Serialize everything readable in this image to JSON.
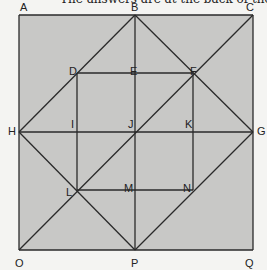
{
  "caption": "The answers are at the back of the book.",
  "diagram": {
    "fill": "#c8c8c6",
    "stroke": "#2a2a2a",
    "points": {
      "A": [
        19,
        15
      ],
      "B": [
        135,
        15
      ],
      "C": [
        253,
        15
      ],
      "D": [
        77,
        73
      ],
      "E": [
        135,
        73
      ],
      "F": [
        193,
        73
      ],
      "H": [
        19,
        132
      ],
      "I": [
        77,
        132
      ],
      "J": [
        135,
        132
      ],
      "K": [
        193,
        132
      ],
      "G": [
        253,
        132
      ],
      "L": [
        77,
        190
      ],
      "M": [
        135,
        190
      ],
      "N": [
        193,
        190
      ],
      "O": [
        19,
        250
      ],
      "P": [
        135,
        250
      ],
      "Q": [
        253,
        250
      ]
    },
    "labels": [
      {
        "text": "A",
        "x": 20,
        "y": 11
      },
      {
        "text": "B",
        "x": 131,
        "y": 11
      },
      {
        "text": "C",
        "x": 246,
        "y": 11
      },
      {
        "text": "D",
        "x": 69,
        "y": 75
      },
      {
        "text": "E",
        "x": 130,
        "y": 75
      },
      {
        "text": "F",
        "x": 190,
        "y": 75
      },
      {
        "text": "H",
        "x": 8,
        "y": 135
      },
      {
        "text": "I",
        "x": 71,
        "y": 128
      },
      {
        "text": "J",
        "x": 128,
        "y": 128
      },
      {
        "text": "K",
        "x": 185,
        "y": 128
      },
      {
        "text": "G",
        "x": 257,
        "y": 135
      },
      {
        "text": "L",
        "x": 66,
        "y": 196
      },
      {
        "text": "M",
        "x": 124,
        "y": 192
      },
      {
        "text": "N",
        "x": 183,
        "y": 192
      },
      {
        "text": "O",
        "x": 15,
        "y": 267
      },
      {
        "text": "P",
        "x": 131,
        "y": 267
      },
      {
        "text": "Q",
        "x": 245,
        "y": 267
      }
    ],
    "segments": [
      [
        "A",
        "C"
      ],
      [
        "C",
        "Q"
      ],
      [
        "Q",
        "O"
      ],
      [
        "O",
        "A"
      ],
      [
        "B",
        "G"
      ],
      [
        "G",
        "P"
      ],
      [
        "P",
        "H"
      ],
      [
        "H",
        "B"
      ],
      [
        "O",
        "C"
      ],
      [
        "B",
        "P"
      ],
      [
        "H",
        "G"
      ],
      [
        "D",
        "F"
      ],
      [
        "D",
        "L"
      ],
      [
        "L",
        "N"
      ],
      [
        "F",
        "N"
      ]
    ]
  }
}
